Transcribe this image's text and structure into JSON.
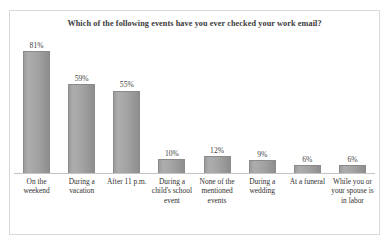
{
  "chart_data": {
    "type": "bar",
    "title": "Which of the following events have you ever checked your work email?",
    "xlabel": "",
    "ylabel": "",
    "ylim": [
      0,
      90
    ],
    "grid": false,
    "legend": "none",
    "categories": [
      "On the weekend",
      "During a vacation",
      "After 11 p.m.",
      "During a child's school event",
      "None of the mentioned events",
      "During a wedding",
      "At a funeral",
      "While you or your spouse is in labor"
    ],
    "values": [
      81,
      59,
      55,
      10,
      12,
      9,
      6,
      6
    ],
    "value_labels": [
      "81%",
      "59%",
      "55%",
      "10%",
      "12%",
      "9%",
      "6%",
      "6%"
    ],
    "bar_color": "#a2a2a2",
    "bar_border_color": "#8a8a8a",
    "axis_color": "#c4c4c4",
    "frame_color": "#d9d9d9",
    "title_color": "#3a3a3a",
    "label_color": "#33312f"
  }
}
